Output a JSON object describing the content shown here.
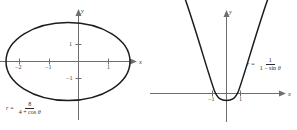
{
  "figure": {
    "background_color": "#ffffff",
    "curve_color": "#1c1c1e",
    "axis_color": "#6e6e72",
    "text_color": "#3a3a3c"
  },
  "charts": [
    {
      "id": "ellipse-polar-plot",
      "type": "line",
      "title": "",
      "xlabel": "x",
      "ylabel": "y",
      "equation": {
        "lhs": "r",
        "equals": "=",
        "numerator": "8",
        "denominator_prefix": "4 + cos ",
        "denominator_symbol": "θ",
        "plain": "r = 8 / (4 + cos θ)"
      },
      "xticks": [
        "−2",
        "−1",
        "1"
      ],
      "xtick_values": [
        -2,
        -1,
        1
      ],
      "yticks": [
        "1",
        "−1"
      ],
      "ytick_values": [
        1,
        -1
      ],
      "grid": false,
      "legend": "none",
      "curve_kind": "ellipse",
      "curve_note": "polar conic with eccentricity 0.25, closed ellipse"
    },
    {
      "id": "parabola-polar-plot",
      "type": "line",
      "title": "",
      "xlabel": "x",
      "ylabel": "y",
      "equation": {
        "lhs": "r",
        "equals": "=",
        "numerator": "1",
        "denominator_prefix": "1 − sin ",
        "denominator_symbol": "θ",
        "plain": "r = 1 / (1 − sin θ)"
      },
      "xticks": [
        "−1",
        "1"
      ],
      "xtick_values": [
        -1,
        1
      ],
      "yticks": [],
      "ytick_values": [],
      "grid": false,
      "legend": "none",
      "curve_kind": "parabola",
      "curve_note": "upward opening parabola, vertex below origin at y = -0.5"
    }
  ]
}
